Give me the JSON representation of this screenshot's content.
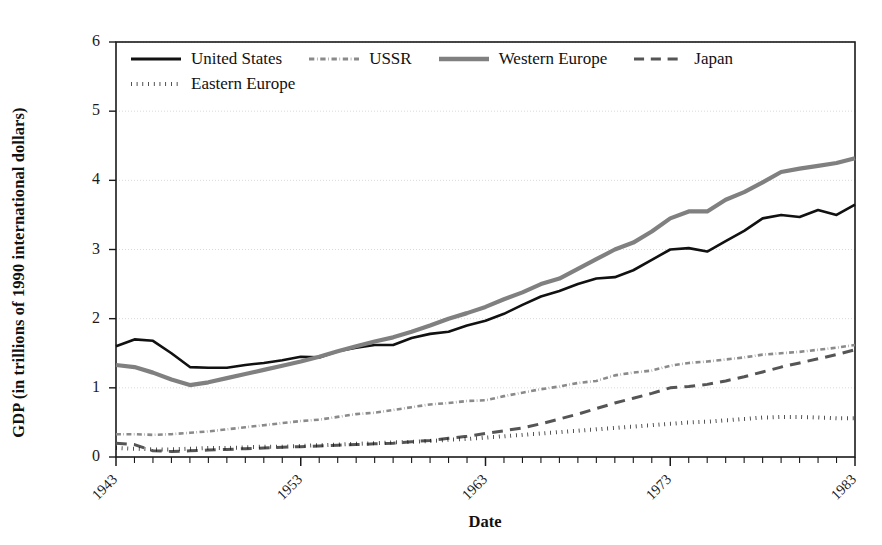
{
  "chart_data": {
    "type": "line",
    "title": "",
    "xlabel": "Date",
    "ylabel": "GDP (in trillions of 1990 international dollars)",
    "xlim": [
      1943,
      1983
    ],
    "ylim": [
      0,
      6
    ],
    "ytick_labels": [
      "0",
      "1",
      "2",
      "3",
      "4",
      "5",
      "6"
    ],
    "ytick_values": [
      0,
      1,
      2,
      3,
      4,
      5,
      6
    ],
    "xtick_labels": [
      "1943",
      "1953",
      "1963",
      "1973",
      "1983"
    ],
    "xtick_values": [
      1943,
      1953,
      1963,
      1973,
      1983
    ],
    "grid": "horizontal",
    "legend_position": "top-left-inside",
    "x": [
      1943,
      1944,
      1945,
      1946,
      1947,
      1948,
      1949,
      1950,
      1951,
      1952,
      1953,
      1954,
      1955,
      1956,
      1957,
      1958,
      1959,
      1960,
      1961,
      1962,
      1963,
      1964,
      1965,
      1966,
      1967,
      1968,
      1969,
      1970,
      1971,
      1972,
      1973,
      1974,
      1975,
      1976,
      1977,
      1978,
      1979,
      1980,
      1981,
      1982,
      1983
    ],
    "series": [
      {
        "name": "United States",
        "style": "solid",
        "color": "#111111",
        "width": 2.6,
        "values": [
          1.6,
          1.7,
          1.68,
          1.5,
          1.3,
          1.29,
          1.29,
          1.33,
          1.36,
          1.4,
          1.45,
          1.44,
          1.53,
          1.58,
          1.62,
          1.62,
          1.72,
          1.78,
          1.81,
          1.9,
          1.97,
          2.07,
          2.2,
          2.32,
          2.4,
          2.5,
          2.58,
          2.6,
          2.7,
          2.85,
          3.0,
          3.02,
          2.97,
          3.12,
          3.27,
          3.45,
          3.5,
          3.47,
          3.57,
          3.5,
          3.65
        ]
      },
      {
        "name": "USSR",
        "style": "dash-dot",
        "color": "#8a8a8a",
        "width": 2.6,
        "values": [
          0.33,
          0.33,
          0.32,
          0.33,
          0.35,
          0.37,
          0.4,
          0.43,
          0.46,
          0.49,
          0.52,
          0.54,
          0.58,
          0.62,
          0.64,
          0.68,
          0.72,
          0.76,
          0.78,
          0.81,
          0.82,
          0.88,
          0.93,
          0.98,
          1.02,
          1.07,
          1.1,
          1.18,
          1.22,
          1.25,
          1.32,
          1.36,
          1.38,
          1.41,
          1.44,
          1.48,
          1.5,
          1.52,
          1.55,
          1.58,
          1.62
        ]
      },
      {
        "name": "Western Europe",
        "style": "solid",
        "color": "#808080",
        "width": 4.2,
        "values": [
          1.33,
          1.3,
          1.22,
          1.12,
          1.04,
          1.08,
          1.14,
          1.2,
          1.26,
          1.32,
          1.38,
          1.45,
          1.53,
          1.6,
          1.67,
          1.73,
          1.81,
          1.9,
          2.0,
          2.08,
          2.17,
          2.28,
          2.38,
          2.5,
          2.58,
          2.72,
          2.86,
          3.0,
          3.1,
          3.26,
          3.45,
          3.55,
          3.55,
          3.72,
          3.83,
          3.97,
          4.12,
          4.17,
          4.21,
          4.25,
          4.32
        ]
      },
      {
        "name": "Japan",
        "style": "long-dash",
        "color": "#555555",
        "width": 3.0,
        "values": [
          0.2,
          0.18,
          0.09,
          0.08,
          0.09,
          0.1,
          0.11,
          0.12,
          0.13,
          0.14,
          0.15,
          0.16,
          0.17,
          0.18,
          0.19,
          0.2,
          0.22,
          0.24,
          0.27,
          0.3,
          0.34,
          0.38,
          0.42,
          0.48,
          0.55,
          0.62,
          0.7,
          0.78,
          0.85,
          0.92,
          1.0,
          1.02,
          1.05,
          1.1,
          1.16,
          1.23,
          1.3,
          1.36,
          1.42,
          1.48,
          1.55
        ]
      },
      {
        "name": "Eastern Europe",
        "style": "dotted",
        "color": "#111111",
        "width": 4.0,
        "values": [
          0.13,
          0.12,
          0.11,
          0.11,
          0.12,
          0.13,
          0.13,
          0.14,
          0.15,
          0.15,
          0.16,
          0.17,
          0.18,
          0.19,
          0.2,
          0.21,
          0.22,
          0.23,
          0.25,
          0.26,
          0.28,
          0.3,
          0.32,
          0.34,
          0.36,
          0.38,
          0.4,
          0.42,
          0.44,
          0.46,
          0.48,
          0.5,
          0.51,
          0.53,
          0.55,
          0.57,
          0.58,
          0.58,
          0.57,
          0.56,
          0.56
        ]
      }
    ]
  },
  "axes": {
    "y_title": "GDP (in trillions of 1990 international dollars)",
    "x_title": "Date"
  },
  "legend": {
    "items": [
      {
        "label": "United States",
        "style": "solid",
        "color": "#111111"
      },
      {
        "label": "USSR",
        "style": "dash-dot",
        "color": "#8a8a8a"
      },
      {
        "label": "Western Europe",
        "style": "solid",
        "color": "#808080"
      },
      {
        "label": "Japan",
        "style": "long-dash",
        "color": "#555555"
      },
      {
        "label": "Eastern Europe",
        "style": "dotted",
        "color": "#111111"
      }
    ]
  },
  "style": {
    "plot_border": "#1a1a1a",
    "gridline": "#d9d9d9",
    "background": "#ffffff"
  }
}
